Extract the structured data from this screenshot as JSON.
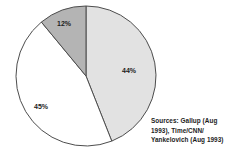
{
  "chart_data": {
    "type": "pie",
    "title": "",
    "subtitle": "",
    "xlabel": "",
    "ylabel": "",
    "grid": false,
    "legend_position": "none",
    "labels_inside": true,
    "center": {
      "x": 86,
      "y": 76
    },
    "radius": 70,
    "start_angle_deg": 0,
    "direction": "clockwise",
    "categories": [
      "44%",
      "45%",
      "12%"
    ],
    "values": [
      44,
      45,
      12
    ],
    "slices": [
      {
        "label": "44%",
        "value": 44,
        "color": "#e2e2e2",
        "stroke": "#4d4d4d",
        "start_angle_deg": 0,
        "end_angle_deg": 158.4,
        "label_x": 129,
        "label_y": 73
      },
      {
        "label": "45%",
        "value": 45,
        "color": "#ffffff",
        "stroke": "#4d4d4d",
        "start_angle_deg": 158.4,
        "end_angle_deg": 320.4,
        "label_x": 41,
        "label_y": 109
      },
      {
        "label": "12%",
        "value": 12,
        "color": "#b4b4b4",
        "stroke": "#4d4d4d",
        "start_angle_deg": 320.4,
        "end_angle_deg": 360,
        "label_x": 64,
        "label_y": 26
      }
    ]
  },
  "source_note": {
    "text": "Sources: Gallup (Aug 1993), Time/CNN/ Yankelovich (Aug 1993)"
  },
  "colors": {
    "slice_light": "#e2e2e2",
    "slice_white": "#ffffff",
    "slice_gray": "#b4b4b4",
    "outline": "#4d4d4d",
    "text": "#1c1c1c",
    "background": "#ffffff"
  }
}
